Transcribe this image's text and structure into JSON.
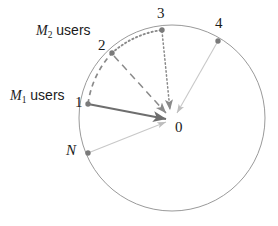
{
  "figure": {
    "type": "circle-diagram",
    "background_color": "#ffffff",
    "width": 278,
    "height": 226,
    "circle": {
      "center_x": 172,
      "center_y": 118,
      "radius": 93,
      "stroke_color": "#9a9a9a",
      "stroke_width": 1,
      "fill": "none"
    },
    "node_color": "#7a7a7a",
    "node_radius": 2.6,
    "accent_dark": "#6e6e6e",
    "accent_light": "#c2c2c2",
    "nodes": [
      {
        "id": "center",
        "label": "0",
        "x": 172,
        "y": 118,
        "label_x": 176,
        "label_y": 120,
        "marker": false
      },
      {
        "id": "n1",
        "label": "1",
        "x": 88,
        "y": 104,
        "marker": true
      },
      {
        "id": "n2",
        "label": "2",
        "x": 112,
        "y": 53,
        "marker": true
      },
      {
        "id": "n3",
        "label": "3",
        "x": 162,
        "y": 30,
        "marker": true
      },
      {
        "id": "n4",
        "label": "4",
        "x": 218,
        "y": 41,
        "marker": true
      },
      {
        "id": "nN",
        "label": "N",
        "x": 88,
        "y": 153,
        "marker": true
      }
    ],
    "labels": [
      {
        "id": "label-m2-users",
        "text": "M2 users",
        "base": "M",
        "sub": "2",
        "suffix": " users",
        "x": 36,
        "y": 30,
        "font_size": 14
      },
      {
        "id": "label-m1-users",
        "text": "M1 users",
        "base": "M",
        "sub": "1",
        "suffix": " users",
        "x": 10,
        "y": 95,
        "font_size": 14
      }
    ],
    "numbers": [
      {
        "id": "num-0",
        "text": "0",
        "x": 175,
        "y": 122,
        "font_size": 15
      },
      {
        "id": "num-1",
        "text": "1",
        "x": 75,
        "y": 95,
        "font_size": 15
      },
      {
        "id": "num-2",
        "text": "2",
        "x": 98,
        "y": 40,
        "font_size": 15
      },
      {
        "id": "num-3",
        "text": "3",
        "x": 157,
        "y": 6,
        "font_size": 15
      },
      {
        "id": "num-4",
        "text": "4",
        "x": 215,
        "y": 16,
        "font_size": 15
      },
      {
        "id": "num-N",
        "text": "N",
        "x": 66,
        "y": 143,
        "font_size": 15
      }
    ],
    "edges": [
      {
        "id": "edge-1-to-0",
        "from": "n1",
        "to": "center",
        "style": "solid",
        "color": "#6e6e6e",
        "width": 2.0,
        "arrow": true
      },
      {
        "id": "edge-2-to-0",
        "from": "n2",
        "to": "center",
        "style": "dashed",
        "color": "#8a8a8a",
        "width": 1.5,
        "arrow": true
      },
      {
        "id": "edge-3-to-0",
        "from": "n3",
        "to": "center",
        "style": "dotted",
        "color": "#8a8a8a",
        "width": 1.5,
        "arrow": true
      },
      {
        "id": "edge-4-to-0",
        "from": "n4",
        "to": "center",
        "style": "solid",
        "color": "#c8c8c8",
        "width": 1.0,
        "arrow": true
      },
      {
        "id": "edge-N-to-0",
        "from": "nN",
        "to": "center",
        "style": "solid",
        "color": "#c8c8c8",
        "width": 1.0,
        "arrow": true
      }
    ],
    "arcs": [
      {
        "id": "arc-1-to-2",
        "from": "n1",
        "to": "n2",
        "style": "dashed",
        "color": "#8a8a8a",
        "width": 1.6
      },
      {
        "id": "arc-2-to-3",
        "from": "n2",
        "to": "n3",
        "style": "dotted",
        "color": "#8a8a8a",
        "width": 1.6
      }
    ]
  }
}
